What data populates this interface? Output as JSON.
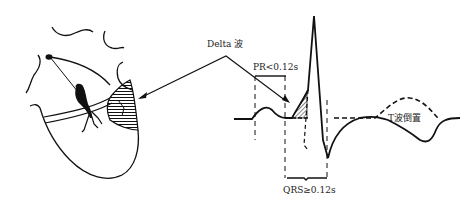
{
  "diagram": {
    "labels": {
      "delta_wave": "Delta 波",
      "pr_interval": "PR<0.12s",
      "qrs_duration": "QRS≥0.12s",
      "t_wave": "T波倒置"
    },
    "parts": {
      "heart": "heart-with-accessory-pathway",
      "ecg": "ecg-tracing-with-delta-wave"
    },
    "colors": {
      "ink": "#111111",
      "background": "#ffffff"
    }
  }
}
